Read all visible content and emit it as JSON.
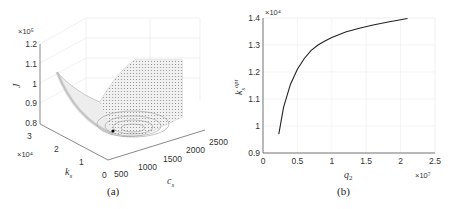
{
  "chart_data": [
    {
      "id": "a",
      "type": "surface3d",
      "caption": "(a)",
      "zlabel": "J",
      "xlabel": "c_s",
      "ylabel": "k_s",
      "z_exponent": "×10⁵",
      "y_exponent": "×10⁴",
      "zticks": [
        "0.8",
        "0.9",
        "1",
        "1.1",
        "1.2"
      ],
      "yticks": [
        "0",
        "1",
        "2",
        "3"
      ],
      "xticks": [
        "500",
        "1000",
        "1500",
        "2000",
        "2500"
      ],
      "zlim": [
        80000,
        120000
      ],
      "ylim": [
        0,
        30000
      ],
      "xlim": [
        500,
        2500
      ],
      "minimum_marker": {
        "c_s": 900,
        "k_s": 13500,
        "J": 82000
      },
      "grid": true
    },
    {
      "id": "b",
      "type": "line",
      "caption": "(b)",
      "xlabel": "q₂",
      "ylabel": "k_s^opt",
      "x_exponent": "×10⁷",
      "y_exponent": "×10⁴",
      "xticks": [
        "0",
        "0.5",
        "1",
        "1.5",
        "2",
        "2.5"
      ],
      "yticks": [
        "0.9",
        "1",
        "1.1",
        "1.2",
        "1.3",
        "1.4"
      ],
      "xlim": [
        0,
        25000000
      ],
      "ylim": [
        9000,
        14000
      ],
      "grid": true,
      "series": [
        {
          "name": "k_s^opt",
          "x": [
            2300000,
            3000000,
            4000000,
            5000000,
            6000000,
            7000000,
            8000000,
            9000000,
            10000000,
            12000000,
            14000000,
            16000000,
            18000000,
            21000000
          ],
          "y": [
            9700,
            10700,
            11550,
            12100,
            12500,
            12800,
            13000,
            13150,
            13280,
            13480,
            13620,
            13740,
            13840,
            13980
          ]
        }
      ]
    }
  ]
}
